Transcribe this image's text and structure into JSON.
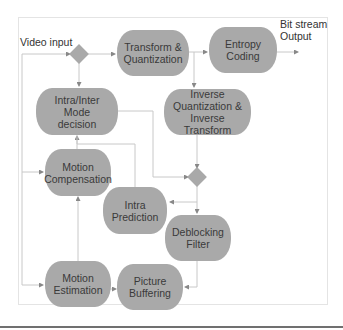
{
  "diagram": {
    "labels": {
      "video_input": "Video input",
      "bitstream_output_line1": "Bit stream",
      "bitstream_output_line2": "Output"
    },
    "nodes": [
      {
        "id": "transform_quant",
        "label": "Transform & Quantization"
      },
      {
        "id": "entropy_coding",
        "label": "Entropy Coding"
      },
      {
        "id": "mode_decision",
        "label": "Intra/Inter Mode decision"
      },
      {
        "id": "inverse_quant_transform",
        "label": "Inverse Quantization & Inverse Transform"
      },
      {
        "id": "motion_compensation",
        "label": "Motion Compensation"
      },
      {
        "id": "intra_prediction",
        "label": "Intra Prediction"
      },
      {
        "id": "deblocking_filter",
        "label": "Deblocking Filter"
      },
      {
        "id": "motion_estimation",
        "label": "Motion Estimation"
      },
      {
        "id": "picture_buffering",
        "label": "Picture Buffering"
      }
    ],
    "decisions": [
      {
        "id": "input_junction"
      },
      {
        "id": "reconstruction_junction"
      }
    ],
    "edges": [
      {
        "from": "video_input",
        "to": "input_junction"
      },
      {
        "from": "input_junction",
        "to": "transform_quant"
      },
      {
        "from": "input_junction",
        "to": "mode_decision"
      },
      {
        "from": "video_input",
        "to": "motion_compensation"
      },
      {
        "from": "video_input",
        "to": "motion_estimation"
      },
      {
        "from": "transform_quant",
        "to": "entropy_coding"
      },
      {
        "from": "transform_quant",
        "to": "inverse_quant_transform"
      },
      {
        "from": "entropy_coding",
        "to": "bitstream_output"
      },
      {
        "from": "inverse_quant_transform",
        "to": "reconstruction_junction"
      },
      {
        "from": "mode_decision",
        "to": "reconstruction_junction"
      },
      {
        "from": "reconstruction_junction",
        "to": "intra_prediction"
      },
      {
        "from": "reconstruction_junction",
        "to": "deblocking_filter"
      },
      {
        "from": "intra_prediction",
        "to": "mode_decision"
      },
      {
        "from": "motion_compensation",
        "to": "mode_decision"
      },
      {
        "from": "motion_estimation",
        "to": "motion_compensation"
      },
      {
        "from": "motion_estimation",
        "to": "picture_buffering"
      },
      {
        "from": "deblocking_filter",
        "to": "picture_buffering"
      }
    ],
    "colors": {
      "node_fill": "#a9a9a9",
      "edge": "#c8c8c8",
      "text": "#3a3a3a"
    }
  }
}
